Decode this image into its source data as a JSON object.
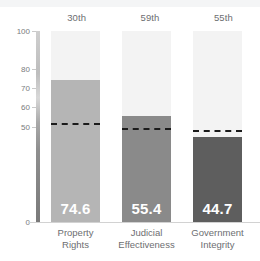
{
  "chart_data": {
    "type": "bar",
    "title": "",
    "subtitle": "",
    "xlabel": "",
    "ylabel": "",
    "ylim": [
      0,
      100
    ],
    "grid": false,
    "legend_position": "none",
    "categories": [
      "Property Rights",
      "Judicial Effectiveness",
      "Government Integrity"
    ],
    "category_lines": [
      [
        "Property",
        "Rights"
      ],
      [
        "Judicial",
        "Effectiveness"
      ],
      [
        "Government",
        "Integrity"
      ]
    ],
    "values": [
      74.6,
      55.4,
      44.7
    ],
    "value_labels": [
      "74.6",
      "55.4",
      "44.7"
    ],
    "rank_labels": [
      "30th",
      "59th",
      "55th"
    ],
    "reference_lines": [
      51.0,
      48.0,
      47.0
    ],
    "bar_colors": [
      "#b5b5b5",
      "#8a8a8a",
      "#5e5e5e"
    ],
    "column_background_color": "#f3f3f3",
    "reference_line_color": "#1b1b1b",
    "value_label_color": "#ffffff",
    "axis_tick_values": [
      100,
      80,
      70,
      60,
      50,
      0
    ],
    "axis_tick_labels": [
      "100",
      "80",
      "70",
      "60",
      "50",
      "0"
    ],
    "axis_label_color": "#7a7b7d"
  }
}
